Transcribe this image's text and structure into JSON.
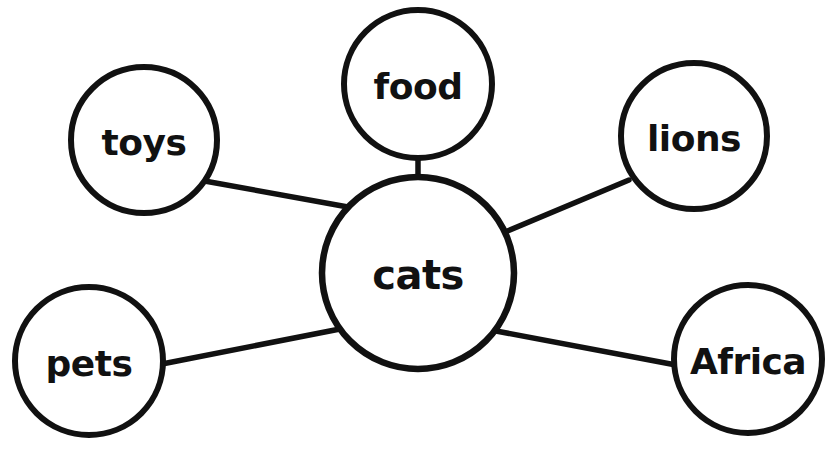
{
  "diagram": {
    "type": "word-web",
    "background_color": "#ffffff",
    "stroke_color": "#111111",
    "fill_color": "#ffffff",
    "text_color": "#111111",
    "stroke_width": 6,
    "edge_width": 5.5,
    "canvas": {
      "width": 835,
      "height": 450
    },
    "center_node": {
      "id": "cats",
      "label": "cats",
      "cx": 418,
      "cy": 273,
      "r": 96,
      "font_size": 40
    },
    "satellite_nodes": [
      {
        "id": "toys",
        "label": "toys",
        "cx": 144,
        "cy": 140,
        "r": 73,
        "font_size": 36
      },
      {
        "id": "food",
        "label": "food",
        "cx": 418,
        "cy": 84,
        "r": 74,
        "font_size": 36
      },
      {
        "id": "lions",
        "label": "lions",
        "cx": 694,
        "cy": 136,
        "r": 73,
        "font_size": 36
      },
      {
        "id": "pets",
        "label": "pets",
        "cx": 89,
        "cy": 361,
        "r": 74,
        "font_size": 36
      },
      {
        "id": "africa",
        "label": "Africa",
        "cx": 748,
        "cy": 359,
        "r": 74,
        "font_size": 36
      }
    ],
    "edges": [
      {
        "id": "edge-cats-toys",
        "from": "cats",
        "to": "toys",
        "x1": 348,
        "y1": 207,
        "x2": 199,
        "y2": 180
      },
      {
        "id": "edge-cats-food",
        "from": "cats",
        "to": "food",
        "x1": 418,
        "y1": 186,
        "x2": 418,
        "y2": 157
      },
      {
        "id": "edge-cats-lions",
        "from": "cats",
        "to": "lions",
        "x1": 505,
        "y1": 232,
        "x2": 629,
        "y2": 180
      },
      {
        "id": "edge-cats-pets",
        "from": "cats",
        "to": "pets",
        "x1": 340,
        "y1": 329,
        "x2": 162,
        "y2": 364
      },
      {
        "id": "edge-cats-africa",
        "from": "cats",
        "to": "africa",
        "x1": 496,
        "y1": 331,
        "x2": 676,
        "y2": 365
      }
    ]
  }
}
